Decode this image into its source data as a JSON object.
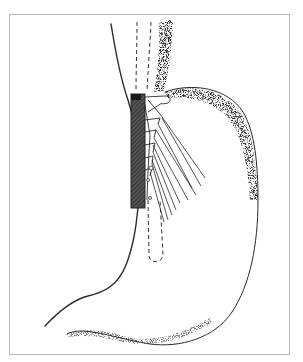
{
  "figure": {
    "colors": {
      "line": "#2a2a2a",
      "stipple": "#3a3a3a",
      "frame": "#b8b8b8",
      "background": "#ffffff",
      "cartridge": "#333333"
    },
    "frame": {
      "left": 9,
      "top": 14,
      "right": 290,
      "bottom": 355
    }
  }
}
